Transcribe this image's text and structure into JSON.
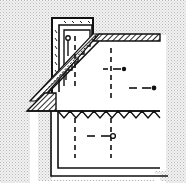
{
  "diagram": {
    "type": "technical cross-section drawing",
    "colors": {
      "background": "#ffffff",
      "ground_fill": "#d9d9d9",
      "line": "#111111"
    },
    "elements": [
      {
        "name": "chimney-wall-outer"
      },
      {
        "name": "chimney-wall-inner"
      },
      {
        "name": "stepped-inner-wall"
      },
      {
        "name": "hatched-roof-slab"
      },
      {
        "name": "sloped-hatched-band"
      },
      {
        "name": "zigzag-seal-line"
      },
      {
        "name": "cavity-outer-wall"
      },
      {
        "name": "cavity-inner-wall"
      },
      {
        "name": "dashed-centerline"
      },
      {
        "name": "anchor-pin",
        "count": 4
      }
    ]
  }
}
